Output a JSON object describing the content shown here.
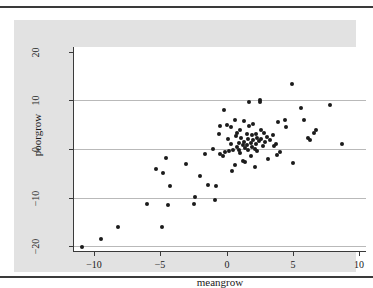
{
  "figure": {
    "background_color": "#e2e2e2",
    "plot_background_color": "#ffffff",
    "marker_color": "#1b1b1b",
    "grid_color": "#b9b9b9",
    "axis_color": "#3a3a3a"
  },
  "chart_data": {
    "type": "scatter",
    "title": "",
    "xlabel": "meangrow",
    "ylabel": "poorgrow",
    "xlim": [
      -11.5,
      10.5
    ],
    "ylim": [
      -21,
      21
    ],
    "xticks": [
      -10,
      -5,
      0,
      5,
      10
    ],
    "xticklabels": [
      "-10",
      "-5",
      "0",
      "5",
      "10"
    ],
    "yticks": [
      -20,
      -10,
      0,
      10,
      20
    ],
    "yticklabels": [
      "-20",
      "-10",
      "0",
      "10",
      "20"
    ],
    "grid": "horizontal",
    "legend": "none",
    "series": [
      {
        "name": "observations",
        "marker": "filled-circle",
        "points": [
          [
            -10.9,
            -20.1
          ],
          [
            -9.5,
            -18.5
          ],
          [
            -8.2,
            -16.1
          ],
          [
            -6.0,
            -11.4
          ],
          [
            -5.3,
            -4.2
          ],
          [
            -4.9,
            -16.0
          ],
          [
            -4.8,
            -5.0
          ],
          [
            -4.6,
            -1.9
          ],
          [
            -4.4,
            -11.5
          ],
          [
            -4.3,
            -7.6
          ],
          [
            -3.1,
            -3.1
          ],
          [
            -2.5,
            -11.3
          ],
          [
            -2.4,
            -9.8
          ],
          [
            -2.0,
            -5.5
          ],
          [
            -1.6,
            -1.1
          ],
          [
            -1.4,
            -7.5
          ],
          [
            -1.0,
            0.0
          ],
          [
            -0.9,
            -10.5
          ],
          [
            -0.8,
            -7.6
          ],
          [
            -0.6,
            3.1
          ],
          [
            -0.5,
            4.7
          ],
          [
            -0.5,
            -1.1
          ],
          [
            -0.3,
            -1.4
          ],
          [
            -0.2,
            8.1
          ],
          [
            -0.1,
            -0.6
          ],
          [
            0.0,
            5.0
          ],
          [
            0.1,
            2.0
          ],
          [
            0.2,
            -0.3
          ],
          [
            0.3,
            4.6
          ],
          [
            0.3,
            1.1
          ],
          [
            0.4,
            -4.6
          ],
          [
            0.5,
            -0.1
          ],
          [
            0.6,
            6.0
          ],
          [
            0.6,
            -3.3
          ],
          [
            0.7,
            2.6
          ],
          [
            0.8,
            0.4
          ],
          [
            0.8,
            3.3
          ],
          [
            0.9,
            1.2
          ],
          [
            0.9,
            -0.2
          ],
          [
            1.0,
            3.9
          ],
          [
            1.0,
            -0.8
          ],
          [
            1.1,
            2.2
          ],
          [
            1.2,
            0.8
          ],
          [
            1.2,
            -2.4
          ],
          [
            1.3,
            5.8
          ],
          [
            1.3,
            1.5
          ],
          [
            1.4,
            0.2
          ],
          [
            1.4,
            -2.6
          ],
          [
            1.5,
            3.2
          ],
          [
            1.5,
            0.9
          ],
          [
            1.6,
            2.0
          ],
          [
            1.6,
            -0.2
          ],
          [
            1.7,
            9.7
          ],
          [
            1.7,
            4.8
          ],
          [
            1.8,
            1.3
          ],
          [
            1.8,
            -1.4
          ],
          [
            1.9,
            2.8
          ],
          [
            1.9,
            0.5
          ],
          [
            2.0,
            5.1
          ],
          [
            2.0,
            1.8
          ],
          [
            2.1,
            0.1
          ],
          [
            2.1,
            -3.7
          ],
          [
            2.2,
            3.0
          ],
          [
            2.2,
            1.0
          ],
          [
            2.3,
            2.3
          ],
          [
            2.3,
            -0.4
          ],
          [
            2.4,
            1.6
          ],
          [
            2.5,
            10.2
          ],
          [
            2.5,
            9.7
          ],
          [
            2.6,
            4.0
          ],
          [
            2.6,
            2.1
          ],
          [
            2.7,
            0.7
          ],
          [
            2.8,
            3.4
          ],
          [
            2.9,
            1.4
          ],
          [
            3.0,
            2.5
          ],
          [
            3.1,
            -2.0
          ],
          [
            3.3,
            1.9
          ],
          [
            3.5,
            2.9
          ],
          [
            3.6,
            0.6
          ],
          [
            3.7,
            1.1
          ],
          [
            3.8,
            -1.2
          ],
          [
            3.9,
            5.5
          ],
          [
            4.0,
            -0.7
          ],
          [
            4.4,
            6.0
          ],
          [
            4.5,
            4.6
          ],
          [
            4.9,
            13.4
          ],
          [
            5.0,
            -2.8
          ],
          [
            5.6,
            8.4
          ],
          [
            5.8,
            6.0
          ],
          [
            6.1,
            2.3
          ],
          [
            6.3,
            1.9
          ],
          [
            6.6,
            3.4
          ],
          [
            6.7,
            3.9
          ],
          [
            7.8,
            9.0
          ],
          [
            8.7,
            1.0
          ]
        ]
      }
    ]
  }
}
